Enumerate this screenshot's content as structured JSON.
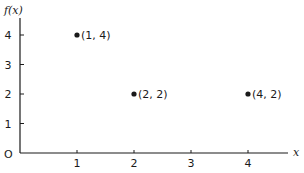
{
  "chart_data": {
    "type": "scatter",
    "title": "",
    "xlabel": "x",
    "ylabel": "f(x)",
    "origin_label": "O",
    "xlim": [
      0,
      4.7
    ],
    "ylim": [
      0,
      4.6
    ],
    "x_ticks": [
      1,
      2,
      3,
      4
    ],
    "y_ticks": [
      1,
      2,
      3,
      4
    ],
    "grid": false,
    "legend": null,
    "points": [
      {
        "x": 1,
        "y": 4,
        "label": "(1, 4)"
      },
      {
        "x": 2,
        "y": 2,
        "label": "(2, 2)"
      },
      {
        "x": 4,
        "y": 2,
        "label": "(4, 2)"
      }
    ]
  },
  "layout": {
    "origin_px": [
      20,
      153
    ],
    "x_unit_px": 57,
    "y_unit_px": 29.5,
    "x_axis_end_px": 288,
    "y_axis_top_px": 18
  },
  "colors": {
    "ink": "#1a1a1a",
    "background": "#ffffff"
  }
}
